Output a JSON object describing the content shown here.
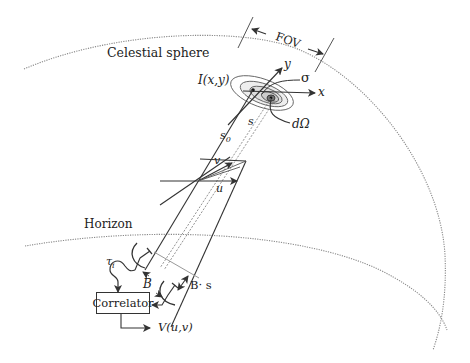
{
  "diagram": {
    "labels": {
      "celestial_sphere": "Celestial sphere",
      "fov": "FOV",
      "brightness": "I(x,y)",
      "axis_y": "y",
      "axis_x": "x",
      "sigma": "σ",
      "solid_angle": "dΩ",
      "s": "s",
      "s0": "s",
      "s0_sub": "0",
      "v": "v",
      "u": "u",
      "horizon": "Horizon",
      "tau": "τ",
      "tau_sub": "i",
      "baseline": "B",
      "b_dot_s": "B· s",
      "correlator": "Correlator",
      "visibility": "V(u,v)"
    },
    "colors": {
      "line": "#333333",
      "dotted": "#888888",
      "contour_fill": "#e6e6e6",
      "contour_fill_inner": "#bdbdbd"
    }
  }
}
